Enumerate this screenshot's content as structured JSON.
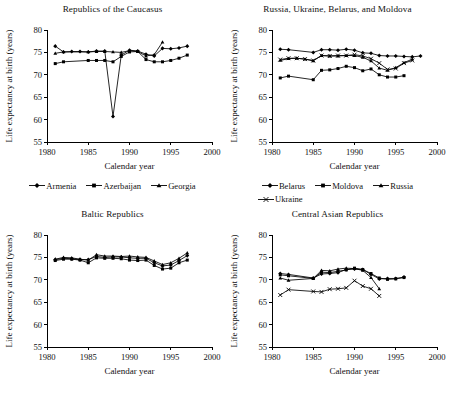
{
  "figure": {
    "width": 450,
    "height": 405,
    "background": "#ffffff",
    "ink_color": "#000000"
  },
  "axis": {
    "xlabel": "Calendar year",
    "ylabel": "Life expectancy at birth (years)",
    "xticks": [
      1980,
      1985,
      1990,
      1995,
      2000
    ],
    "yticks": [
      55,
      60,
      65,
      70,
      75,
      80
    ],
    "xlim": [
      1980,
      2000
    ],
    "ylim": [
      55,
      80
    ],
    "grid": false
  },
  "markers": {
    "diamond": "diamond-marker",
    "square": "square-marker",
    "triangle": "triangle-marker",
    "cross": "x-marker"
  },
  "chart_data": [
    {
      "id": "caucasus",
      "type": "line",
      "title": "Republics of the Caucasus",
      "xlabel": "Calendar year",
      "ylabel": "Life expectancy at birth (years)",
      "xlim": [
        1980,
        2000
      ],
      "ylim": [
        55,
        80
      ],
      "xticks": [
        1980,
        1985,
        1990,
        1995,
        2000
      ],
      "yticks": [
        55,
        60,
        65,
        70,
        75,
        80
      ],
      "grid": false,
      "legend_position": "below",
      "series": [
        {
          "name": "Armenia",
          "marker": "diamond",
          "x": [
            1981,
            1982,
            1983,
            1984,
            1985,
            1986,
            1987,
            1988,
            1989,
            1990,
            1991,
            1992,
            1993,
            1994,
            1995,
            1996,
            1997
          ],
          "y": [
            76.4,
            75.1,
            75.2,
            75.2,
            75.1,
            75.3,
            75.3,
            60.7,
            74.4,
            75.5,
            75.3,
            74.6,
            74.2,
            75.9,
            75.8,
            76.0,
            76.4
          ]
        },
        {
          "name": "Azerbaijan",
          "marker": "square",
          "x": [
            1981,
            1982,
            1985,
            1986,
            1987,
            1988,
            1989,
            1990,
            1991,
            1992,
            1993,
            1994,
            1995,
            1996,
            1997
          ],
          "y": [
            72.5,
            72.9,
            73.2,
            73.2,
            73.2,
            72.9,
            74.1,
            75.1,
            75.2,
            73.4,
            72.9,
            72.9,
            73.2,
            73.7,
            74.4
          ]
        },
        {
          "name": "Georgia",
          "marker": "triangle",
          "x": [
            1981,
            1982,
            1985,
            1986,
            1987,
            1988,
            1989,
            1990,
            1991,
            1992,
            1993,
            1994
          ],
          "y": [
            74.8,
            75.1,
            75.1,
            75.2,
            75.2,
            75.1,
            75.0,
            75.4,
            75.2,
            74.2,
            74.5,
            77.3
          ]
        }
      ]
    },
    {
      "id": "western",
      "type": "line",
      "title": "Russia, Ukraine, Belarus, and Moldova",
      "xlabel": "Calendar year",
      "ylabel": "Life expectancy at birth (years)",
      "xlim": [
        1980,
        2000
      ],
      "ylim": [
        55,
        80
      ],
      "xticks": [
        1980,
        1985,
        1990,
        1995,
        2000
      ],
      "yticks": [
        55,
        60,
        65,
        70,
        75,
        80
      ],
      "grid": false,
      "legend_position": "below",
      "series": [
        {
          "name": "Belarus",
          "marker": "diamond",
          "x": [
            1981,
            1982,
            1985,
            1986,
            1987,
            1988,
            1989,
            1990,
            1991,
            1992,
            1993,
            1994,
            1995,
            1996,
            1997,
            1998
          ],
          "y": [
            75.7,
            75.6,
            75.0,
            75.6,
            75.6,
            75.5,
            75.7,
            75.5,
            74.9,
            74.8,
            74.3,
            74.2,
            74.2,
            74.1,
            74.0,
            74.2
          ]
        },
        {
          "name": "Moldova",
          "marker": "square",
          "x": [
            1981,
            1982,
            1985,
            1986,
            1987,
            1988,
            1989,
            1990,
            1991,
            1992,
            1993,
            1994,
            1995,
            1996
          ],
          "y": [
            69.3,
            69.7,
            68.9,
            71.0,
            71.1,
            71.4,
            71.9,
            71.6,
            70.9,
            71.3,
            70.0,
            69.5,
            69.5,
            69.8
          ]
        },
        {
          "name": "Russia",
          "marker": "triangle",
          "x": [
            1981,
            1982,
            1983,
            1984,
            1985,
            1986,
            1987,
            1988,
            1989,
            1990,
            1991,
            1992,
            1993,
            1994,
            1995,
            1996,
            1997
          ],
          "y": [
            73.2,
            73.6,
            73.7,
            73.5,
            73.1,
            74.3,
            74.2,
            74.2,
            74.3,
            74.3,
            73.9,
            73.1,
            71.5,
            71.0,
            71.6,
            72.7,
            73.5
          ]
        },
        {
          "name": "Ukraine",
          "marker": "cross",
          "x": [
            1981,
            1982,
            1983,
            1984,
            1985,
            1986,
            1987,
            1988,
            1989,
            1990,
            1991,
            1992,
            1993,
            1994,
            1995,
            1996,
            1997
          ],
          "y": [
            73.4,
            73.7,
            73.7,
            73.5,
            73.2,
            74.3,
            74.2,
            74.3,
            74.3,
            74.5,
            74.2,
            73.6,
            72.6,
            71.2,
            71.4,
            72.6,
            73.2
          ]
        }
      ]
    },
    {
      "id": "baltic",
      "type": "line",
      "title": "Baltic Republics",
      "xlabel": "Calendar year",
      "ylabel": "Life expectancy at birth (years)",
      "xlim": [
        1980,
        2000
      ],
      "ylim": [
        55,
        80
      ],
      "xticks": [
        1980,
        1985,
        1990,
        1995,
        2000
      ],
      "yticks": [
        55,
        60,
        65,
        70,
        75,
        80
      ],
      "grid": false,
      "legend_position": "none",
      "series": [
        {
          "name": "Estonia",
          "marker": "diamond",
          "x": [
            1981,
            1982,
            1983,
            1984,
            1985,
            1986,
            1987,
            1988,
            1989,
            1990,
            1991,
            1992,
            1993,
            1994,
            1995,
            1996,
            1997
          ],
          "y": [
            74.5,
            74.8,
            74.7,
            74.5,
            74.5,
            75.2,
            75.0,
            75.1,
            75.1,
            74.9,
            74.8,
            74.8,
            73.8,
            73.1,
            73.3,
            74.3,
            75.4
          ]
        },
        {
          "name": "Latvia",
          "marker": "square",
          "x": [
            1981,
            1982,
            1983,
            1984,
            1985,
            1986,
            1987,
            1988,
            1989,
            1990,
            1991,
            1992,
            1993,
            1994,
            1995,
            1996,
            1997
          ],
          "y": [
            74.3,
            74.6,
            74.6,
            74.4,
            73.8,
            74.9,
            74.8,
            74.8,
            74.7,
            74.4,
            74.3,
            74.4,
            73.2,
            72.4,
            72.6,
            73.8,
            74.4
          ]
        },
        {
          "name": "Lithuania",
          "marker": "triangle",
          "x": [
            1981,
            1982,
            1983,
            1984,
            1985,
            1986,
            1987,
            1988,
            1989,
            1990,
            1991,
            1992,
            1993,
            1994,
            1995,
            1996,
            1997
          ],
          "y": [
            74.6,
            75.0,
            74.9,
            74.6,
            74.4,
            75.6,
            75.3,
            75.3,
            75.2,
            75.3,
            75.1,
            75.0,
            74.2,
            73.4,
            73.8,
            74.8,
            76.0
          ]
        }
      ]
    },
    {
      "id": "central_asia",
      "type": "line",
      "title": "Central Asian Republics",
      "xlabel": "Calendar year",
      "ylabel": "Life expectancy at birth (years)",
      "xlim": [
        1980,
        2000
      ],
      "ylim": [
        55,
        80
      ],
      "xticks": [
        1980,
        1985,
        1990,
        1995,
        2000
      ],
      "yticks": [
        55,
        60,
        65,
        70,
        75,
        80
      ],
      "grid": false,
      "legend_position": "none",
      "series": [
        {
          "name": "Kazakhstan",
          "marker": "diamond",
          "x": [
            1981,
            1982,
            1985,
            1986,
            1987,
            1988,
            1989,
            1990,
            1991,
            1992,
            1993,
            1994,
            1995,
            1996
          ],
          "y": [
            71.4,
            71.2,
            70.4,
            71.3,
            71.4,
            71.6,
            72.3,
            72.4,
            72.3,
            71.2,
            70.2,
            70.3,
            70.3,
            70.6
          ]
        },
        {
          "name": "Kyrgyzstan",
          "marker": "square",
          "x": [
            1981,
            1982,
            1985,
            1986,
            1987,
            1988,
            1989,
            1990,
            1991,
            1992,
            1993,
            1994,
            1995,
            1996
          ],
          "y": [
            71.1,
            70.9,
            70.3,
            71.7,
            71.6,
            71.9,
            72.2,
            72.6,
            72.3,
            71.4,
            70.4,
            70.1,
            70.2,
            70.5
          ]
        },
        {
          "name": "Tajikistan",
          "marker": "triangle",
          "x": [
            1981,
            1982,
            1985,
            1986,
            1987,
            1988,
            1989,
            1990,
            1991,
            1992,
            1993
          ],
          "y": [
            70.4,
            69.9,
            70.3,
            72.1,
            72.0,
            72.4,
            72.6,
            72.5,
            72.1,
            70.5,
            68.0
          ]
        },
        {
          "name": "Turkmenistan",
          "marker": "cross",
          "x": [
            1981,
            1982,
            1985,
            1986,
            1987,
            1988,
            1989,
            1990,
            1991,
            1992,
            1993
          ],
          "y": [
            66.6,
            67.8,
            67.4,
            67.3,
            67.9,
            68.0,
            68.2,
            69.8,
            68.6,
            68.0,
            66.4
          ]
        }
      ]
    }
  ],
  "panels": [
    {
      "id": "caucasus",
      "title": "Republics of the Caucasus",
      "legend": [
        {
          "label": "Armenia",
          "marker": "diamond"
        },
        {
          "label": "Azerbaijan",
          "marker": "square"
        },
        {
          "label": "Georgia",
          "marker": "triangle"
        }
      ]
    },
    {
      "id": "western",
      "title": "Russia, Ukraine, Belarus, and Moldova",
      "legend": [
        {
          "label": "Belarus",
          "marker": "diamond"
        },
        {
          "label": "Moldova",
          "marker": "square"
        },
        {
          "label": "Russia",
          "marker": "triangle"
        },
        {
          "label": "Ukraine",
          "marker": "cross"
        }
      ]
    },
    {
      "id": "baltic",
      "title": "Baltic Republics",
      "legend": []
    },
    {
      "id": "central_asia",
      "title": "Central Asian Republics",
      "legend": []
    }
  ]
}
